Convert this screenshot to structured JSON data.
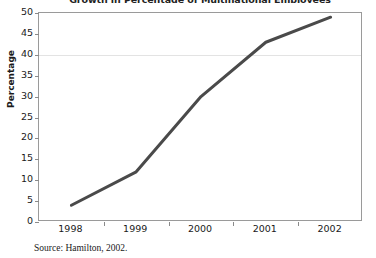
{
  "chart_data": {
    "type": "line",
    "title": "Growth in Percentage of Multinational Employees",
    "xlabel": "",
    "ylabel": "Percentage",
    "categories": [
      "1998",
      "1999",
      "2000",
      "2001",
      "2002"
    ],
    "x": [
      1998,
      1999,
      2000,
      2001,
      2002
    ],
    "values": [
      4,
      12,
      30,
      43,
      49
    ],
    "series": [
      {
        "name": "Percentage of multinational employees",
        "values": [
          4,
          12,
          30,
          43,
          49
        ]
      }
    ],
    "ylim": [
      0,
      50
    ],
    "ytick_labels": [
      "0",
      "5",
      "10",
      "15",
      "20",
      "25",
      "30",
      "35",
      "40",
      "45",
      "50"
    ],
    "ytick_values": [
      0,
      5,
      10,
      15,
      20,
      25,
      30,
      35,
      40,
      45,
      50
    ],
    "xtick_labels": [
      "1998",
      "1999",
      "2000",
      "2001",
      "2002"
    ],
    "grid": "horizontal-faint",
    "legend": "none",
    "line_color": "#4a4a4a",
    "line_width": 3,
    "markers": "none"
  },
  "footer": {
    "source": "Source: Hamilton, 2002."
  },
  "colors": {
    "line": "#4a4a4a",
    "axis": "#9a9a9a",
    "grid": "#e3e3e3",
    "text": "#1a1a1a",
    "background": "#ffffff"
  }
}
